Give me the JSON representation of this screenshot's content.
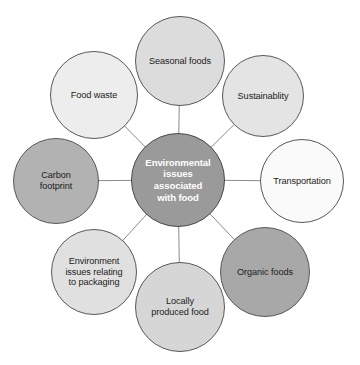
{
  "diagram": {
    "title": "Environmental issues associated with food",
    "background_color": "#ffffff",
    "line_color": "#8b8b8d",
    "hub": {
      "label": "Environmental\nissues\nassociated\nwith food",
      "fill": "#9a9a9a",
      "text_color": "#ffffff",
      "cx": 178,
      "cy": 180,
      "r": 47
    },
    "satellites": [
      {
        "id": "seasonal-foods",
        "label": "Seasonal foods",
        "fill": "#dcdcdc",
        "text_color": "#1d1d1b",
        "cx": 180,
        "cy": 61,
        "r": 45
      },
      {
        "id": "sustainablity",
        "label": "Sustainablity",
        "fill": "#e4e4e4",
        "text_color": "#1d1d1b",
        "cx": 263,
        "cy": 96,
        "r": 41
      },
      {
        "id": "transportation",
        "label": "Transportation",
        "fill": "#fafafa",
        "text_color": "#1d1d1b",
        "cx": 302,
        "cy": 181,
        "r": 42
      },
      {
        "id": "organic-foods",
        "label": "Organic foods",
        "fill": "#a8a8a8",
        "text_color": "#1d1d1b",
        "cx": 265,
        "cy": 272,
        "r": 45
      },
      {
        "id": "locally-produced-food",
        "label": "Locally\nproduced food",
        "fill": "#d6d6d6",
        "text_color": "#1d1d1b",
        "cx": 180,
        "cy": 307,
        "r": 45
      },
      {
        "id": "environment-issues-packaging",
        "label": "Environment\nissues relating\nto packaging",
        "fill": "#e0e0e0",
        "text_color": "#1d1d1b",
        "cx": 94,
        "cy": 272,
        "r": 43
      },
      {
        "id": "carbon-footprint",
        "label": "Carbon\nfootprint",
        "fill": "#b2b2b2",
        "text_color": "#1d1d1b",
        "cx": 56,
        "cy": 181,
        "r": 43
      },
      {
        "id": "food-waste",
        "label": "Food waste",
        "fill": "#ededed",
        "text_color": "#1d1d1b",
        "cx": 94,
        "cy": 95,
        "r": 44
      }
    ]
  }
}
